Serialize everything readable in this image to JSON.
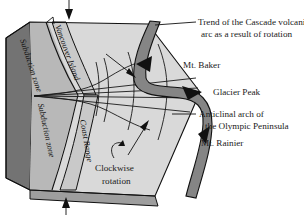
{
  "figure": {
    "labels": {
      "trend_line1": "Trend of the Cascade volcanic",
      "trend_line2": "arc as a result of rotation",
      "mt_baker": "Mt. Baker",
      "glacier_peak": "Glacier Peak",
      "anticlinal_line1": "Anticlinal arch of",
      "anticlinal_line2": "the Olympic Peninsula",
      "mt_rainier": "Mt. Rainier",
      "clockwise_line1": "Clockwise",
      "clockwise_line2": "rotation",
      "subduction_zone_upper": "Subduction zone",
      "subduction_zone_lower": "Subduction zone",
      "vancouver_island": "Vancouver Island",
      "coast_range": "Coast Range"
    },
    "icons": {
      "top_arrow": "arrow-down-icon",
      "bottom_arrow": "arrow-up-icon",
      "rotation_arrow": "clockwise-rotation-arrow-icon",
      "baker_pointer": "arrow-pointer-icon",
      "rainier_pointer": "arrow-pointer-icon",
      "baker_peak": "volcano-triangle-icon",
      "glacier_peak_marker": "volcano-triangle-icon",
      "rainier_peak": "volcano-triangle-icon"
    },
    "colors": {
      "ocean_face": "#737373",
      "top_surface": "#d9d9d9",
      "mid_band": "#b3b3b3",
      "arc_band": "#858585",
      "front_face": "#bfbfbf",
      "peak_fill": "#111111",
      "line": "#111111",
      "text": "#1a1a1a",
      "background": "#ffffff"
    }
  }
}
